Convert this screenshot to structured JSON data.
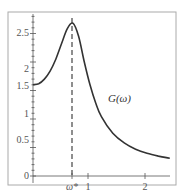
{
  "chart_data": {
    "type": "line",
    "title": "",
    "xlabel": "",
    "ylabel": "",
    "xlim": [
      0,
      2.4
    ],
    "ylim": [
      0,
      2.8
    ],
    "grid": false,
    "legend": null,
    "x_ticks": [
      {
        "value": 0.7,
        "label": "ω*"
      },
      {
        "value": 1,
        "label": "1"
      },
      {
        "value": 2,
        "label": "2"
      }
    ],
    "y_ticks": [
      {
        "value": 0,
        "label": "0"
      },
      {
        "value": 0.5,
        "label": "0.5"
      },
      {
        "value": 1,
        "label": "1"
      },
      {
        "value": 1.5,
        "label": "1.5"
      },
      {
        "value": 2,
        "label": "2"
      },
      {
        "value": 2.5,
        "label": "2.5"
      }
    ],
    "series": [
      {
        "name": "G(ω)",
        "x": [
          0,
          0.1,
          0.2,
          0.3,
          0.4,
          0.5,
          0.6,
          0.7,
          0.8,
          0.9,
          1.0,
          1.1,
          1.2,
          1.4,
          1.6,
          1.8,
          2.0,
          2.2,
          2.4
        ],
        "values": [
          1.6,
          1.62,
          1.7,
          1.84,
          2.05,
          2.32,
          2.58,
          2.68,
          2.45,
          2.0,
          1.6,
          1.28,
          1.04,
          0.75,
          0.58,
          0.47,
          0.4,
          0.35,
          0.31
        ]
      }
    ],
    "annotations": [
      {
        "type": "vertical-dashed-line",
        "x": 0.7,
        "label": "ω*"
      },
      {
        "type": "curve-label",
        "text": "G(ω)",
        "x": 1.3,
        "y": 1.9
      }
    ]
  },
  "labels": {
    "curve": "G(ω)",
    "omega_star": "ω*",
    "x1": "1",
    "x2": "2",
    "y0": "0",
    "y05": "0.5",
    "y1": "1",
    "y15": "1.5",
    "y2": "2",
    "y25": "2.5"
  }
}
